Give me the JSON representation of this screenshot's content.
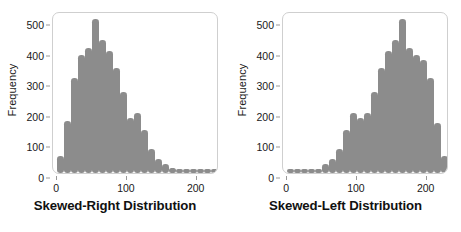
{
  "figure": {
    "background": "#ffffff",
    "bar_color": "#8c8c8c",
    "frame_color": "#cfcfcf",
    "text_color": "#1a1a1a"
  },
  "panels": [
    {
      "id": "skewed-right",
      "title": "Skewed-Right Distribution"
    },
    {
      "id": "skewed-left",
      "title": "Skewed-Left Distribution"
    }
  ],
  "chart_data": [
    {
      "type": "bar",
      "id": "skewed-right",
      "title": "Skewed-Right Distribution",
      "xlabel": "",
      "ylabel": "Frequency",
      "grid": false,
      "legend": false,
      "xlim": [
        -6,
        232
      ],
      "ylim": [
        0,
        530
      ],
      "xticks": [
        0,
        100,
        200
      ],
      "yticks": [
        0,
        100,
        200,
        300,
        400,
        500
      ],
      "bar_width": 7,
      "categories": [
        5,
        15,
        25,
        35,
        45,
        55,
        65,
        75,
        85,
        95,
        105,
        115,
        125,
        135,
        145,
        155,
        165,
        175,
        185,
        195,
        205,
        215,
        225
      ],
      "values": [
        55,
        170,
        310,
        385,
        410,
        505,
        435,
        400,
        345,
        265,
        180,
        195,
        140,
        80,
        45,
        30,
        15,
        10,
        10,
        5,
        5,
        5,
        5
      ]
    },
    {
      "type": "bar",
      "id": "skewed-left",
      "title": "Skewed-Left Distribution",
      "xlabel": "",
      "ylabel": "Frequency",
      "grid": false,
      "legend": false,
      "xlim": [
        -6,
        232
      ],
      "ylim": [
        0,
        530
      ],
      "xticks": [
        0,
        100,
        200
      ],
      "yticks": [
        0,
        100,
        200,
        300,
        400,
        500
      ],
      "bar_width": 7,
      "categories": [
        5,
        15,
        25,
        35,
        45,
        55,
        65,
        75,
        85,
        95,
        105,
        115,
        125,
        135,
        145,
        155,
        165,
        175,
        185,
        195,
        205,
        215,
        225
      ],
      "values": [
        5,
        5,
        5,
        5,
        10,
        30,
        45,
        80,
        140,
        195,
        180,
        195,
        265,
        345,
        400,
        435,
        505,
        410,
        385,
        370,
        310,
        165,
        55
      ]
    }
  ]
}
